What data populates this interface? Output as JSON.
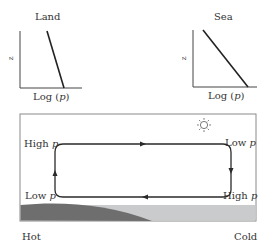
{
  "panels": {
    "land": {
      "title": "Land",
      "y_label": "z",
      "x_label_prefix": "Log (",
      "x_label_var": "p",
      "x_label_suffix": ")"
    },
    "sea": {
      "title": "Sea",
      "y_label": "z",
      "x_label_prefix": "Log (",
      "x_label_var": "p",
      "x_label_suffix": ")"
    }
  },
  "circulation": {
    "top_left_label": "High",
    "top_right_label": "Low",
    "bottom_left_label": "Low",
    "bottom_right_label": "High",
    "pressure_var": "p",
    "hot_label": "Hot",
    "cold_label": "Cold",
    "sun_icon": "sun-icon"
  },
  "colors": {
    "line": "#2a2a2a",
    "land_fill": "#6e6e6e",
    "sea_fill": "#c9cbcc",
    "frame": "#8a8a8a"
  }
}
